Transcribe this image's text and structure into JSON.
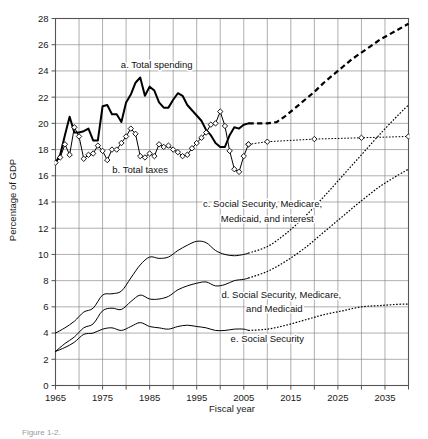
{
  "figure": {
    "caption": "Figure 1-2.",
    "yaxis_title": "Percentage of GDP",
    "xaxis_title": "Fiscal year"
  },
  "chart_data": {
    "type": "line",
    "title": "",
    "xlabel": "Fiscal year",
    "ylabel": "Percentage of GDP",
    "xlim": [
      1965,
      2040
    ],
    "ylim": [
      0,
      28
    ],
    "grid": true,
    "legend_position": "inline-annotations",
    "x_ticks_major": [
      1965,
      1975,
      1985,
      1995,
      2005,
      2015,
      2025,
      2035
    ],
    "x_ticks_minor": [
      1970,
      1980,
      1990,
      2000,
      2010,
      2020,
      2030,
      2040
    ],
    "x_tick_labels": [
      "1965",
      "1975",
      "1985",
      "1995",
      "2005",
      "2015",
      "2025",
      "2035"
    ],
    "y_ticks": [
      0,
      2,
      4,
      6,
      8,
      10,
      12,
      14,
      16,
      18,
      20,
      22,
      24,
      26,
      28
    ],
    "y_tick_labels": [
      "0",
      "2",
      "4",
      "6",
      "8",
      "10",
      "12",
      "14",
      "16",
      "18",
      "20",
      "22",
      "24",
      "26",
      "28"
    ],
    "annotations": [
      {
        "id": "a",
        "text": "a. Total spending",
        "x": 1986.5,
        "y": 24.2,
        "anchor": "middle"
      },
      {
        "id": "b",
        "text": "b. Total taxes",
        "x": 1983.0,
        "y": 16.2,
        "anchor": "middle"
      },
      {
        "id": "c",
        "text": "c. Social Security, Medicare,",
        "x": 2009.0,
        "y": 13.6,
        "anchor": "middle"
      },
      {
        "id": "c2",
        "text": "Medicaid, and interest",
        "x": 2010.0,
        "y": 12.5,
        "anchor": "middle"
      },
      {
        "id": "d",
        "text": "d. Social Security, Medicare,",
        "x": 2013.0,
        "y": 6.65,
        "anchor": "middle"
      },
      {
        "id": "d2",
        "text": "and Medicaid",
        "x": 2011.5,
        "y": 5.6,
        "anchor": "middle"
      },
      {
        "id": "e",
        "text": "e. Social Security",
        "x": 2010.0,
        "y": 3.3,
        "anchor": "middle"
      }
    ],
    "series": [
      {
        "name": "a. Total spending",
        "style": "solid",
        "marker": "none",
        "color": "#000000",
        "width": 2.0,
        "x": [
          1965,
          1966,
          1967,
          1968,
          1969,
          1970,
          1971,
          1972,
          1973,
          1974,
          1975,
          1976,
          1977,
          1978,
          1979,
          1980,
          1981,
          1982,
          1983,
          1984,
          1985,
          1986,
          1987,
          1988,
          1989,
          1990,
          1991,
          1992,
          1993,
          1994,
          1995,
          1996,
          1997,
          1998,
          1999,
          2000,
          2001,
          2002,
          2003,
          2004,
          2005,
          2006
        ],
        "values": [
          17.0,
          17.6,
          19.1,
          20.5,
          19.3,
          19.3,
          19.4,
          19.6,
          18.7,
          18.7,
          21.3,
          21.4,
          20.7,
          20.7,
          20.1,
          21.6,
          22.2,
          23.1,
          23.5,
          22.1,
          22.8,
          22.5,
          21.6,
          21.2,
          21.2,
          21.8,
          22.3,
          22.1,
          21.4,
          21.0,
          20.6,
          20.2,
          19.5,
          19.1,
          18.5,
          18.2,
          18.2,
          19.1,
          19.7,
          19.6,
          19.9,
          20.0
        ]
      },
      {
        "name": "a. Total spending (projected)",
        "style": "dashed",
        "marker": "none",
        "color": "#000000",
        "width": 2.2,
        "x": [
          2006,
          2008,
          2010,
          2012,
          2014,
          2016,
          2018,
          2020,
          2022,
          2024,
          2026,
          2028,
          2030,
          2032,
          2034,
          2036,
          2038,
          2040
        ],
        "values": [
          20.0,
          20.0,
          20.0,
          20.1,
          20.6,
          21.2,
          21.8,
          22.4,
          23.1,
          23.7,
          24.3,
          24.9,
          25.4,
          25.9,
          26.4,
          26.8,
          27.2,
          27.6
        ]
      },
      {
        "name": "b. Total taxes",
        "style": "solid",
        "marker": "diamond",
        "color": "#000000",
        "width": 1.0,
        "x": [
          1965,
          1966,
          1967,
          1968,
          1969,
          1970,
          1971,
          1972,
          1973,
          1974,
          1975,
          1976,
          1977,
          1978,
          1979,
          1980,
          1981,
          1982,
          1983,
          1984,
          1985,
          1986,
          1987,
          1988,
          1989,
          1990,
          1991,
          1992,
          1993,
          1994,
          1995,
          1996,
          1997,
          1998,
          1999,
          2000,
          2001,
          2002,
          2003,
          2004,
          2005,
          2006
        ],
        "values": [
          17.0,
          17.4,
          18.4,
          17.6,
          19.7,
          19.0,
          17.3,
          17.6,
          17.7,
          18.3,
          17.9,
          17.2,
          18.0,
          18.0,
          18.5,
          19.0,
          19.6,
          19.2,
          17.5,
          17.4,
          17.7,
          17.5,
          18.4,
          18.2,
          18.3,
          18.0,
          17.8,
          17.5,
          17.6,
          18.1,
          18.5,
          18.9,
          19.3,
          19.9,
          20.0,
          20.9,
          19.8,
          17.9,
          16.5,
          16.3,
          17.5,
          18.4
        ]
      },
      {
        "name": "b. Total taxes (projected)",
        "style": "dotted",
        "marker": "diamond",
        "color": "#000000",
        "width": 1.0,
        "x": [
          2006,
          2010,
          2020,
          2030,
          2040
        ],
        "values": [
          18.4,
          18.6,
          18.8,
          18.9,
          19.0
        ]
      },
      {
        "name": "c. Social Security, Medicare, Medicaid, and interest",
        "style": "solid",
        "marker": "none",
        "color": "#000000",
        "width": 1.0,
        "x": [
          1965,
          1967,
          1969,
          1971,
          1973,
          1975,
          1977,
          1979,
          1981,
          1983,
          1985,
          1987,
          1989,
          1991,
          1993,
          1995,
          1997,
          1999,
          2001,
          2003,
          2005,
          2006
        ],
        "values": [
          4.0,
          4.4,
          4.9,
          5.6,
          5.9,
          6.9,
          7.0,
          7.2,
          8.2,
          9.2,
          9.8,
          9.7,
          9.8,
          10.3,
          10.7,
          11.0,
          10.9,
          10.3,
          10.0,
          9.9,
          10.0,
          10.1
        ]
      },
      {
        "name": "c. Social Security, Medicare, Medicaid, and interest (projected)",
        "style": "dotted",
        "marker": "none",
        "color": "#000000",
        "width": 1.2,
        "x": [
          2006,
          2010,
          2014,
          2018,
          2022,
          2026,
          2030,
          2034,
          2038,
          2040
        ],
        "values": [
          10.1,
          10.6,
          11.6,
          12.9,
          14.4,
          16.0,
          17.6,
          19.2,
          20.7,
          21.4
        ]
      },
      {
        "name": "d. Social Security, Medicare, and Medicaid",
        "style": "solid",
        "marker": "none",
        "color": "#000000",
        "width": 1.0,
        "x": [
          1965,
          1967,
          1969,
          1971,
          1973,
          1975,
          1977,
          1979,
          1981,
          1983,
          1985,
          1987,
          1989,
          1991,
          1993,
          1995,
          1997,
          1999,
          2001,
          2003,
          2005,
          2006
        ],
        "values": [
          2.6,
          3.2,
          3.7,
          4.4,
          4.7,
          5.7,
          5.9,
          5.8,
          6.4,
          6.9,
          6.6,
          6.6,
          6.8,
          7.3,
          7.6,
          7.8,
          7.9,
          7.6,
          7.7,
          8.0,
          8.1,
          8.2
        ]
      },
      {
        "name": "d. Social Security, Medicare, and Medicaid (projected)",
        "style": "dotted",
        "marker": "none",
        "color": "#000000",
        "width": 1.2,
        "x": [
          2006,
          2010,
          2014,
          2018,
          2022,
          2026,
          2030,
          2034,
          2038,
          2040
        ],
        "values": [
          8.2,
          8.7,
          9.5,
          10.5,
          11.7,
          12.9,
          14.1,
          15.2,
          16.1,
          16.5
        ]
      },
      {
        "name": "e. Social Security",
        "style": "solid",
        "marker": "none",
        "color": "#000000",
        "width": 1.0,
        "x": [
          1965,
          1967,
          1969,
          1971,
          1973,
          1975,
          1977,
          1979,
          1981,
          1983,
          1985,
          1987,
          1989,
          1991,
          1993,
          1995,
          1997,
          1999,
          2001,
          2003,
          2005,
          2006
        ],
        "values": [
          2.6,
          2.9,
          3.3,
          3.9,
          4.0,
          4.3,
          4.4,
          4.2,
          4.5,
          4.8,
          4.5,
          4.4,
          4.3,
          4.5,
          4.6,
          4.5,
          4.4,
          4.2,
          4.2,
          4.3,
          4.3,
          4.2
        ]
      },
      {
        "name": "e. Social Security (projected)",
        "style": "dotted",
        "marker": "none",
        "color": "#000000",
        "width": 1.2,
        "x": [
          2006,
          2010,
          2014,
          2018,
          2022,
          2026,
          2030,
          2034,
          2038,
          2040
        ],
        "values": [
          4.2,
          4.3,
          4.6,
          5.0,
          5.4,
          5.7,
          6.0,
          6.1,
          6.2,
          6.2
        ]
      }
    ]
  }
}
